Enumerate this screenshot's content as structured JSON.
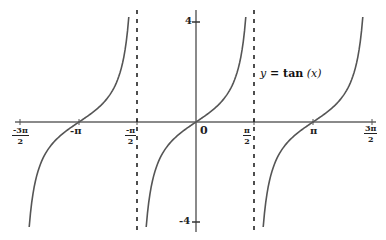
{
  "chart_data": {
    "type": "line",
    "title": "",
    "function": "y = tan(x)",
    "legend_label": "y = tan (x)",
    "xlabel": "",
    "ylabel": "",
    "xlim": [
      -4.712,
      4.712
    ],
    "ylim": [
      -4,
      4
    ],
    "grid": false,
    "x_ticks": [
      {
        "value": -4.712,
        "label": "-3π/2",
        "num": "-3π",
        "den": "2"
      },
      {
        "value": -3.1416,
        "label": "-π"
      },
      {
        "value": -1.5708,
        "label": "-π/2",
        "num": "-π",
        "den": "2"
      },
      {
        "value": 0,
        "label": "0"
      },
      {
        "value": 1.5708,
        "label": "π/2",
        "num": "π",
        "den": "2"
      },
      {
        "value": 3.1416,
        "label": "π"
      },
      {
        "value": 4.712,
        "label": "3π/2",
        "num": "3π",
        "den": "2"
      }
    ],
    "y_ticks": [
      {
        "value": 4,
        "label": "4"
      },
      {
        "value": -4,
        "label": "-4"
      }
    ],
    "asymptotes": [
      {
        "x": -1.5708,
        "label": "-π/2",
        "style": "dashed"
      },
      {
        "x": 1.5708,
        "label": "π/2",
        "style": "dashed"
      }
    ],
    "series": [
      {
        "name": "branch-left",
        "x_range": [
          -4.712,
          -1.5708
        ],
        "zero_at": -3.1416
      },
      {
        "name": "branch-center",
        "x_range": [
          -1.5708,
          1.5708
        ],
        "zero_at": 0
      },
      {
        "name": "branch-right",
        "x_range": [
          1.5708,
          4.712
        ],
        "zero_at": 3.1416
      }
    ],
    "sample_points": {
      "x": [
        -1.326,
        -1.107,
        -0.785,
        -0.464,
        0,
        0.464,
        0.785,
        1.107,
        1.326
      ],
      "y": [
        -4,
        -2,
        -1,
        -0.5,
        0,
        0.5,
        1,
        2,
        4
      ]
    },
    "colors": {
      "curve": "#555555",
      "axis": "#777777",
      "asymptote": "#222222"
    }
  },
  "labels": {
    "x_neg_3pi_2_num": "-3π",
    "x_neg_3pi_2_den": "2",
    "x_neg_pi": "-π",
    "x_neg_pi_2_num": "-π",
    "x_neg_pi_2_den": "2",
    "x_zero": "0",
    "x_pi_2_num": "π",
    "x_pi_2_den": "2",
    "x_pi": "π",
    "x_3pi_2_num": "3π",
    "x_3pi_2_den": "2",
    "y_top": "4",
    "y_bottom": "-4",
    "eq_y": "y",
    "eq_eq": " = ",
    "eq_fn": "tan",
    "eq_arg": " (x)"
  }
}
